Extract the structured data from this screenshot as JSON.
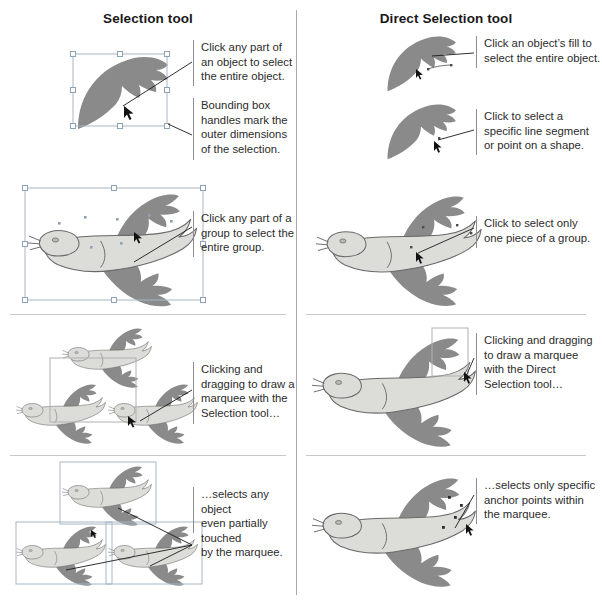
{
  "headers": {
    "left": "Selection tool",
    "right": "Direct Selection tool"
  },
  "callouts": {
    "left": [
      {
        "id": "click-any-part-object",
        "text": "Click any part of\nan object to select\nthe entire object."
      },
      {
        "id": "bounding-box-handles",
        "text": "Bounding box\nhandles mark the\nouter dimensions\nof the selection."
      },
      {
        "id": "click-any-part-group",
        "text": "Click any part of a\ngroup to select the\nentire group."
      },
      {
        "id": "marquee-selection-tool",
        "text": "Clicking and\ndragging to draw a\nmarquee with the\nSelection tool…"
      },
      {
        "id": "selects-any-object",
        "text": "…selects any object\neven partially touched\nby the marquee."
      }
    ],
    "right": [
      {
        "id": "click-object-fill",
        "text": "Click an object’s fill to\nselect the entire object."
      },
      {
        "id": "click-line-segment",
        "text": "Click to select a\nspecific line segment\nor point on a shape."
      },
      {
        "id": "click-one-piece-group",
        "text": "Click to select only\none piece of a group."
      },
      {
        "id": "marquee-direct-selection-tool",
        "text": "Clicking and dragging\nto draw a marquee\nwith the Direct\nSelection tool…"
      },
      {
        "id": "selects-anchor-points",
        "text": "…selects only specific\nanchor points within\nthe marquee."
      }
    ]
  },
  "figures": {
    "left": [
      {
        "id": "wing-shape-selected",
        "caption_ids": [
          "click-any-part-object",
          "bounding-box-handles"
        ]
      },
      {
        "id": "bird-group-selected",
        "caption_ids": [
          "click-any-part-group"
        ]
      },
      {
        "id": "three-birds-marquee",
        "caption_ids": [
          "marquee-selection-tool"
        ]
      },
      {
        "id": "three-birds-all-selected",
        "caption_ids": [
          "selects-any-object"
        ]
      }
    ],
    "right": [
      {
        "id": "wing-fill-clicked",
        "caption_ids": [
          "click-object-fill"
        ]
      },
      {
        "id": "wing-segment-clicked",
        "caption_ids": [
          "click-line-segment"
        ]
      },
      {
        "id": "bird-one-piece-selected",
        "caption_ids": [
          "click-one-piece-group"
        ]
      },
      {
        "id": "bird-tail-marquee",
        "caption_ids": [
          "marquee-direct-selection-tool"
        ]
      },
      {
        "id": "bird-anchor-points-selected",
        "caption_ids": [
          "selects-anchor-points"
        ]
      }
    ]
  },
  "colors": {
    "wing_dark": "#8a8a8a",
    "body_light": "#dcdcd8",
    "outline": "#5a5a5a",
    "selection_blue": "#a7b6c6",
    "marquee": "#b0b0b0",
    "divider": "#a9a9a9",
    "leader_line": "#1a1a1a",
    "text": "#2b2b2b"
  }
}
